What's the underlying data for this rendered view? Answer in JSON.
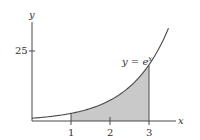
{
  "chart_data": {
    "type": "area",
    "title": "",
    "function": "y = e^x",
    "curve_label": "y = e",
    "curve_label_exponent": "x",
    "xlabel": "x",
    "ylabel": "y",
    "x_ticks": [
      1,
      2,
      3
    ],
    "x_tick_labels": [
      "1",
      "2",
      "3"
    ],
    "y_ticks": [
      25
    ],
    "y_tick_labels": [
      "25"
    ],
    "xlim": [
      0,
      3.5
    ],
    "ylim": [
      0,
      33
    ],
    "shaded_region": {
      "from": 1,
      "to": 3,
      "under": "y = e^x"
    },
    "series": [
      {
        "name": "y = e^x",
        "x": [
          0,
          0.5,
          1,
          1.5,
          2,
          2.5,
          3,
          3.25,
          3.5
        ],
        "values": [
          1.0,
          1.65,
          2.72,
          4.48,
          7.39,
          12.18,
          20.09,
          25.79,
          33.12
        ]
      }
    ],
    "grid": false,
    "legend": "none",
    "colors": {
      "axis": "#4a4a4a",
      "curve": "#4a4a4a",
      "shade": "#c9c9c9"
    }
  }
}
